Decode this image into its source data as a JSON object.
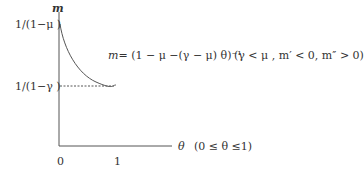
{
  "diagram": {
    "y_axis_label": "m",
    "x_axis_label": "θ",
    "x_range_note": "(0 ≤ θ ≤1)",
    "y_tick_upper": "1/(1−μ )",
    "y_tick_lower": "1/(1−γ )",
    "x_tick_0": "0",
    "x_tick_1": "1",
    "equation_lhs": "m",
    "equation_rhs": "= (1 − μ −(γ − μ) θ)⁻¹",
    "conditions": "(γ < μ , m′ < 0, m″ > 0)",
    "colors": {
      "axis": "#555555",
      "curve": "#555555",
      "dotted": "#555555",
      "text": "#333333"
    }
  }
}
